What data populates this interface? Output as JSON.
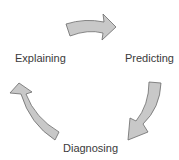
{
  "diagram": {
    "type": "cycle",
    "nodes": [
      {
        "id": "explaining",
        "label": "Explaining"
      },
      {
        "id": "predicting",
        "label": "Predicting"
      },
      {
        "id": "diagnosing",
        "label": "Diagnosing"
      }
    ],
    "edges": [
      {
        "from": "explaining",
        "to": "predicting"
      },
      {
        "from": "predicting",
        "to": "diagnosing"
      },
      {
        "from": "diagnosing",
        "to": "explaining"
      }
    ],
    "colors": {
      "arrow_fill": "#c8c8c8",
      "arrow_stroke": "#6a6a6a",
      "text": "#3a3a3a",
      "background": "#ffffff"
    }
  }
}
